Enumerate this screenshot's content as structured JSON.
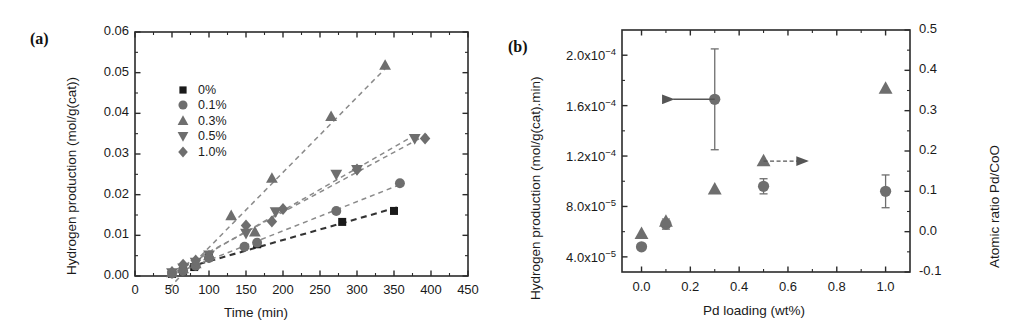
{
  "figure": {
    "panels": [
      {
        "id": "a",
        "label": "(a)",
        "xlabel": "Time (min)",
        "ylabel": "Hydrogen production (mol/g(cat))"
      },
      {
        "id": "b",
        "label": "(b)",
        "xlabel": "Pd loading (wt%)",
        "ylabel_left": "Hydrogen production (mol/g(cat).min)",
        "ylabel_right": "Atomic ratio Pd/CoO"
      }
    ]
  },
  "colors": {
    "black": "#1a1a1a",
    "gray_marker": "#6e6e6e",
    "gray_dark": "#555555",
    "axis": "#2b2b2b",
    "dash": "#8a8a8a",
    "dash_black": "#333333"
  },
  "chart_data": [
    {
      "type": "scatter",
      "panel": "a",
      "title": "",
      "xlabel": "Time (min)",
      "ylabel": "Hydrogen production (mol/g(cat))",
      "xlim": [
        0,
        450
      ],
      "ylim": [
        0.0,
        0.06
      ],
      "xticks": [
        0,
        50,
        100,
        150,
        200,
        250,
        300,
        350,
        400,
        450
      ],
      "xtick_labels": [
        "0",
        "50",
        "100",
        "150",
        "200",
        "250",
        "300",
        "350",
        "400",
        "450"
      ],
      "yticks": [
        0.0,
        0.01,
        0.02,
        0.03,
        0.04,
        0.05,
        0.06
      ],
      "ytick_labels": [
        "0.00",
        "0.01",
        "0.02",
        "0.03",
        "0.04",
        "0.05",
        "0.06"
      ],
      "grid": false,
      "legend_position": "upper-left-inside",
      "series": [
        {
          "name": "0%",
          "marker": "square",
          "color": "#1a1a1a",
          "linestyle": "dashed",
          "x": [
            50,
            65,
            80,
            100,
            165,
            280,
            350
          ],
          "y": [
            0.0005,
            0.0012,
            0.0022,
            0.0048,
            0.0078,
            0.0133,
            0.016
          ]
        },
        {
          "name": "0.1%",
          "marker": "circle",
          "color": "#6e6e6e",
          "linestyle": "dashed",
          "x": [
            50,
            65,
            82,
            100,
            148,
            165,
            272,
            358
          ],
          "y": [
            0.0006,
            0.0013,
            0.0025,
            0.0044,
            0.0072,
            0.0082,
            0.016,
            0.0228
          ]
        },
        {
          "name": "0.3%",
          "marker": "triangle-up",
          "color": "#6e6e6e",
          "linestyle": "dashed",
          "x": [
            50,
            65,
            82,
            100,
            130,
            162,
            185,
            265,
            338
          ],
          "y": [
            0.0008,
            0.0018,
            0.003,
            0.005,
            0.0148,
            0.0108,
            0.024,
            0.0392,
            0.0518
          ]
        },
        {
          "name": "0.5%",
          "marker": "triangle-down",
          "color": "#6e6e6e",
          "linestyle": "dashed",
          "x": [
            50,
            65,
            82,
            100,
            150,
            190,
            272,
            300,
            378
          ],
          "y": [
            0.0008,
            0.002,
            0.0034,
            0.0052,
            0.0105,
            0.0158,
            0.025,
            0.0262,
            0.0338
          ]
        },
        {
          "name": "1.0%",
          "marker": "diamond",
          "color": "#6e6e6e",
          "linestyle": "dashed",
          "x": [
            50,
            65,
            82,
            100,
            150,
            185,
            200,
            300,
            392
          ],
          "y": [
            0.001,
            0.0028,
            0.0038,
            0.0046,
            0.0124,
            0.0134,
            0.0165,
            0.0262,
            0.0338
          ]
        }
      ]
    },
    {
      "type": "scatter",
      "panel": "b",
      "title": "",
      "xlabel": "Pd loading (wt%)",
      "ylabel": "Hydrogen production (mol/g(cat).min)",
      "ylabel_right": "Atomic ratio Pd/CoO",
      "xlim": [
        -0.08,
        1.1
      ],
      "ylim": [
        2.8e-05,
        0.00022
      ],
      "ylim_right": [
        -0.1,
        0.5
      ],
      "xticks": [
        0.0,
        0.2,
        0.4,
        0.6,
        0.8,
        1.0
      ],
      "xtick_labels": [
        "0.0",
        "0.2",
        "0.4",
        "0.6",
        "0.8",
        "1.0"
      ],
      "yticks": [
        4e-05,
        8e-05,
        0.00012,
        0.00016,
        0.0002
      ],
      "ytick_labels": [
        "4.0x10-5",
        "8.0x10-5",
        "1.2x10-4",
        "1.6x10-4",
        "2.0x10-4"
      ],
      "ytick_labels_right": [
        "-0.1",
        "0.0",
        "0.1",
        "0.2",
        "0.3",
        "0.4",
        "0.5"
      ],
      "yticks_right": [
        -0.1,
        0.0,
        0.1,
        0.2,
        0.3,
        0.4,
        0.5
      ],
      "grid": false,
      "series": [
        {
          "name": "Hydrogen production rate",
          "marker": "circle",
          "color": "#6e6e6e",
          "axis": "left",
          "x": [
            0.0,
            0.1,
            0.3,
            0.5,
            1.0
          ],
          "y": [
            4.8e-05,
            6.6e-05,
            0.000165,
            9.6e-05,
            9.2e-05
          ],
          "yerr": [
            0.0,
            4e-06,
            4e-05,
            6e-06,
            1.3e-05
          ]
        },
        {
          "name": "Atomic ratio Pd/CoO",
          "marker": "triangle-up",
          "color": "#6e6e6e",
          "axis": "right",
          "x": [
            0.0,
            0.1,
            0.3,
            0.5,
            1.0
          ],
          "y": [
            -0.005,
            0.025,
            0.105,
            0.175,
            0.355
          ]
        }
      ],
      "annotations": [
        {
          "name": "left-arrow",
          "text": "",
          "from_x": 0.3,
          "to_x": 0.13,
          "y_left": 0.000165,
          "direction": "left"
        },
        {
          "name": "right-arrow",
          "text": "",
          "from_x": 0.5,
          "to_x": 0.68,
          "y_right": 0.175,
          "direction": "right"
        }
      ]
    }
  ]
}
